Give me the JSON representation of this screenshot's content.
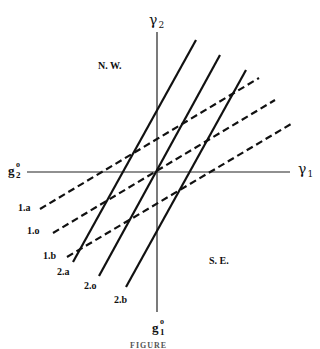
{
  "diagram": {
    "axes": {
      "x_label": {
        "symbol": "γ",
        "subscript": "1"
      },
      "y_label": {
        "symbol": "γ",
        "subscript": "2"
      },
      "x_intercept_label": {
        "base": "g",
        "superscript": "o",
        "subscript": "1"
      },
      "y_intercept_label": {
        "base": "g",
        "superscript": "o",
        "subscript": "2"
      }
    },
    "regions": {
      "nw": "N. W.",
      "se": "S. E."
    },
    "dashed_lines": [
      {
        "label": "1.a"
      },
      {
        "label": "1.o"
      },
      {
        "label": "1.b"
      }
    ],
    "solid_lines": [
      {
        "label": "2.a"
      },
      {
        "label": "2.o"
      },
      {
        "label": "2.b"
      }
    ],
    "caption": "FIGURE"
  }
}
